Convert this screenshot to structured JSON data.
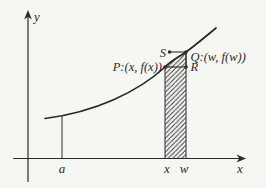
{
  "figure": {
    "colors": {
      "background": "#f6f6f3",
      "ink": "#2b2b2b"
    },
    "axes": {
      "y_label": "y",
      "x_label": "x"
    },
    "tick_labels": {
      "a": "a",
      "x": "x",
      "w": "w"
    },
    "point_labels": {
      "p": "P:(x, f(x))",
      "q": "Q:(w, f(w))",
      "r": "R",
      "s": "S"
    }
  }
}
